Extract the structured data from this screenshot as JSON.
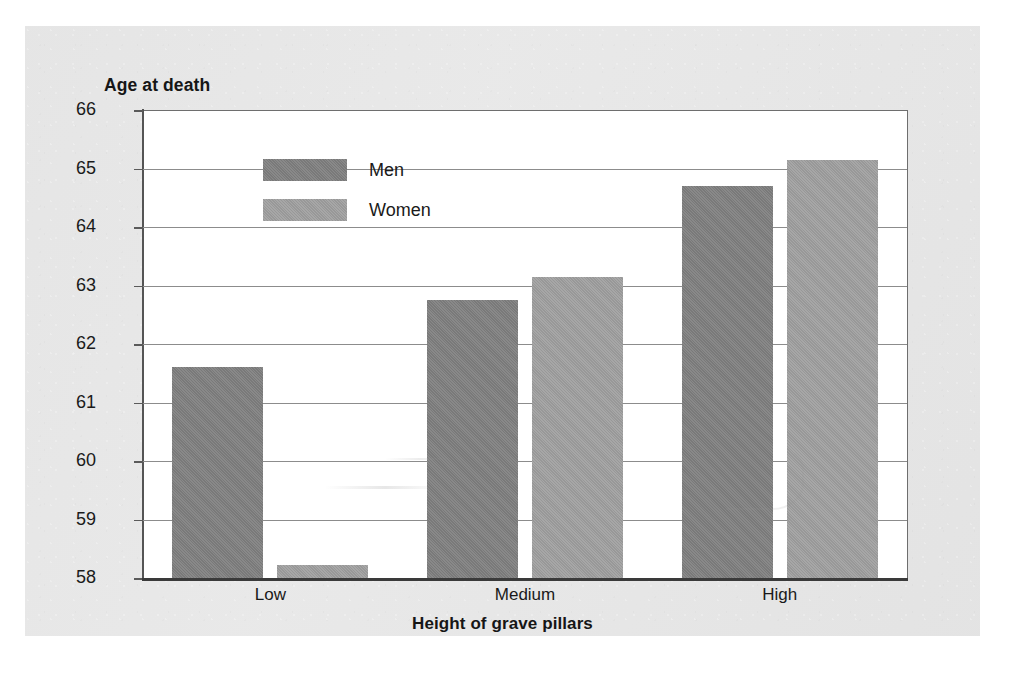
{
  "chart_data": {
    "type": "bar",
    "title": "",
    "ylabel": "Age at death",
    "xlabel": "Height of grave pillars",
    "categories": [
      "Low",
      "Medium",
      "High"
    ],
    "series": [
      {
        "name": "Men",
        "color": "#808080",
        "values": [
          61.6,
          62.75,
          64.7
        ]
      },
      {
        "name": "Women",
        "color": "#9e9e9e",
        "values": [
          58.22,
          63.15,
          65.15
        ]
      }
    ],
    "ylim": [
      58,
      66
    ],
    "ytick_step": 1,
    "yticks": [
      66,
      65,
      64,
      63,
      62,
      61,
      60,
      59,
      58
    ],
    "ytick_labels": [
      "66",
      "65",
      "64",
      "63",
      "62",
      "61",
      "60",
      "59",
      "58"
    ],
    "grid": true,
    "grid_axis": "y",
    "legend_position": "top-left-inside",
    "legend_entries": [
      "Men",
      "Women"
    ],
    "annotations": []
  },
  "axes": {
    "y_title": "Age at death",
    "x_title": "Height of grave pillars"
  },
  "legend": {
    "items": [
      {
        "label": "Men"
      },
      {
        "label": "Women"
      }
    ]
  },
  "corner": {
    "marks": ""
  }
}
